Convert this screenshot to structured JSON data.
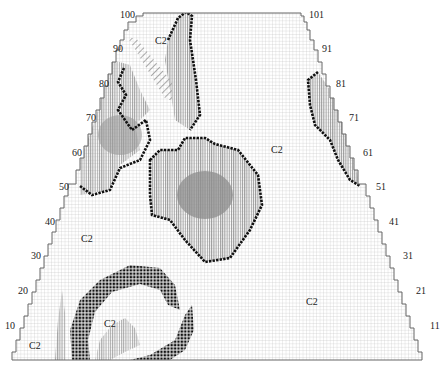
{
  "chart": {
    "type": "knitting-chart",
    "shape": "trapezoid",
    "grid_color": "#b8b8b8",
    "outline_color": "#555555",
    "stitch_color": "#111111",
    "shade_color": "#9a9a9a"
  },
  "row_labels_left": [
    {
      "text": "100",
      "x": 120,
      "y": 10
    },
    {
      "text": "90",
      "x": 113,
      "y": 44
    },
    {
      "text": "80",
      "x": 99,
      "y": 79
    },
    {
      "text": "70",
      "x": 86,
      "y": 113
    },
    {
      "text": "60",
      "x": 72,
      "y": 148
    },
    {
      "text": "50",
      "x": 59,
      "y": 182
    },
    {
      "text": "40",
      "x": 45,
      "y": 217
    },
    {
      "text": "30",
      "x": 31,
      "y": 251
    },
    {
      "text": "20",
      "x": 18,
      "y": 286
    },
    {
      "text": "10",
      "x": 5,
      "y": 321
    }
  ],
  "row_labels_right": [
    {
      "text": "101",
      "x": 309,
      "y": 10
    },
    {
      "text": "91",
      "x": 322,
      "y": 44
    },
    {
      "text": "81",
      "x": 336,
      "y": 79
    },
    {
      "text": "71",
      "x": 349,
      "y": 113
    },
    {
      "text": "61",
      "x": 363,
      "y": 148
    },
    {
      "text": "51",
      "x": 376,
      "y": 182
    },
    {
      "text": "41",
      "x": 389,
      "y": 217
    },
    {
      "text": "31",
      "x": 403,
      "y": 251
    },
    {
      "text": "21",
      "x": 416,
      "y": 286
    },
    {
      "text": "11",
      "x": 430,
      "y": 321
    }
  ],
  "color_labels": [
    {
      "text": "C2",
      "x": 155,
      "y": 36
    },
    {
      "text": "C2",
      "x": 271,
      "y": 145
    },
    {
      "text": "C2",
      "x": 81,
      "y": 234
    },
    {
      "text": "C2",
      "x": 306,
      "y": 297
    },
    {
      "text": "C2",
      "x": 104,
      "y": 319
    },
    {
      "text": "C2",
      "x": 29,
      "y": 341
    }
  ]
}
